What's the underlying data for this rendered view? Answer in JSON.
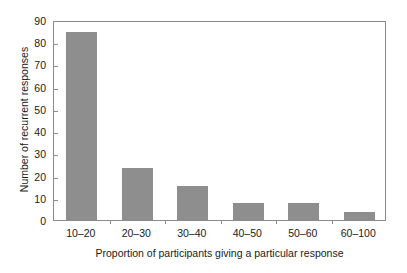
{
  "chart_data": {
    "type": "bar",
    "title": "",
    "subtitle": "",
    "categories": [
      "10–20",
      "20–30",
      "30–40",
      "40–50",
      "50–60",
      "60–100"
    ],
    "values": [
      84,
      23,
      15,
      7,
      7,
      3
    ],
    "series": [
      {
        "name": "Number of recurrent responses",
        "values": [
          84,
          23,
          15,
          7,
          7,
          3
        ]
      }
    ],
    "xlabel": "Proportion of participants giving a particular response",
    "ylabel": "Number of recurrent responses",
    "ylim": [
      0,
      90
    ],
    "ytick_labels": [
      "0",
      "10",
      "20",
      "30",
      "40",
      "50",
      "60",
      "70",
      "80",
      "90"
    ],
    "ytick_values": [
      0,
      10,
      20,
      30,
      40,
      50,
      60,
      70,
      80,
      90
    ],
    "ytick_step": 10,
    "grid": false,
    "legend": null,
    "legend_position": "none",
    "annotations": [],
    "bar_color": "#8e8e8e",
    "frame_color": "#8a8a8a",
    "background_color": "#ffffff",
    "text_color": "#1a1a1a",
    "bar_width_fraction": 0.55
  }
}
